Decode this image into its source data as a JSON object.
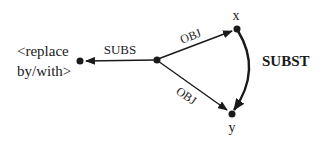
{
  "diagram": {
    "colors": {
      "ink": "#1a1a1a",
      "background": "#ffffff"
    },
    "nodes": {
      "center": {
        "label": ""
      },
      "replace": {
        "label_line1": "<replace",
        "label_line2": "by/with>"
      },
      "x": {
        "label": "x"
      },
      "y": {
        "label": "y"
      }
    },
    "edges": {
      "subs": {
        "label": "SUBS"
      },
      "obj_x": {
        "label": "OBJ"
      },
      "obj_y": {
        "label": "OBJ"
      },
      "subst": {
        "label": "SUBST"
      }
    }
  }
}
